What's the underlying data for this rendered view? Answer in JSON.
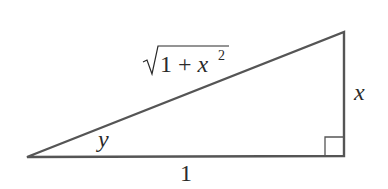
{
  "diagram": {
    "type": "right-triangle",
    "stroke_color": "#555555",
    "text_color": "#2a2a2a",
    "vertices": {
      "left": [
        27,
        157
      ],
      "right_angle": [
        344,
        156
      ],
      "top": [
        344,
        32
      ]
    },
    "labels": {
      "hypotenuse": {
        "radical": "1 + x",
        "exponent": "2",
        "full": "√(1 + x²)"
      },
      "opposite": "x",
      "adjacent": "1",
      "angle": "y"
    },
    "right_angle_marker": true
  }
}
